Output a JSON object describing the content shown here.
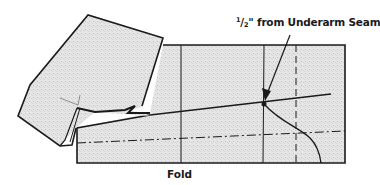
{
  "diagram": {
    "type": "sewing-pattern-illustration",
    "labels": {
      "seam_fraction_numerator": "1",
      "seam_fraction_denominator": "2",
      "seam_text": "\" from Underarm Seam",
      "fold": "Fold"
    },
    "colors": {
      "line": "#1a1a1a",
      "fabric_fill": "#e4e4e4",
      "background": "#ffffff"
    },
    "elements": [
      "folded sleeve piece (upper left)",
      "pattern body rectangle",
      "vertical solid guide line",
      "underarm seam vertical line",
      "dashed vertical line",
      "dash-dot fold line",
      "slanted sleeve line",
      "curved underarm seam line",
      "arrow pointing to underarm seam"
    ]
  }
}
